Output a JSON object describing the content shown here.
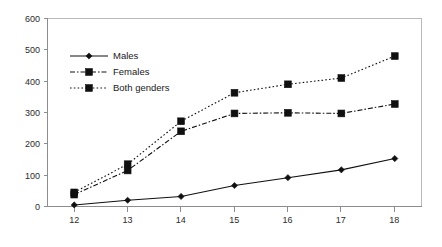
{
  "chart_data": {
    "type": "line",
    "title": "",
    "subtitle": "",
    "xlabel": "",
    "ylabel": "",
    "x": [
      12,
      13,
      14,
      15,
      16,
      17,
      18
    ],
    "categories": [
      "12",
      "13",
      "14",
      "15",
      "16",
      "17",
      "18"
    ],
    "xlim": [
      11.5,
      18.5
    ],
    "ylim": [
      0,
      600
    ],
    "y_ticks": [
      0,
      100,
      200,
      300,
      400,
      500,
      600
    ],
    "x_ticks": [
      12,
      13,
      14,
      15,
      16,
      17,
      18
    ],
    "grid": false,
    "legend_position": "inside-upper-left",
    "series": [
      {
        "name": "Males",
        "values": [
          5,
          20,
          32,
          67,
          92,
          117,
          153
        ],
        "line_style": "solid",
        "marker": "diamond",
        "color": "#101010"
      },
      {
        "name": "Females",
        "values": [
          38,
          115,
          240,
          297,
          299,
          297,
          327
        ],
        "line_style": "dash-dot",
        "marker": "square",
        "color": "#101010"
      },
      {
        "name": "Both genders",
        "values": [
          45,
          135,
          272,
          363,
          390,
          410,
          480
        ],
        "line_style": "dotted",
        "marker": "square",
        "color": "#101010"
      }
    ],
    "y_tick_labels": [
      "0",
      "100",
      "200",
      "300",
      "400",
      "500",
      "600"
    ],
    "x_tick_labels": [
      "12",
      "13",
      "14",
      "15",
      "16",
      "17",
      "18"
    ],
    "legend": [
      "Males",
      "Females",
      "Both genders"
    ]
  },
  "colors": {
    "background": "#ffffff",
    "axis": "#8d8d8d",
    "border": "#b9b9b9",
    "ink": "#101010",
    "tick_text": "#2b2b2b"
  }
}
